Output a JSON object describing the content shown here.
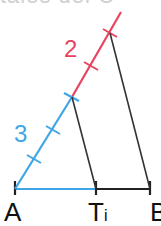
{
  "heading": {
    "clipped_text": "tales del C"
  },
  "colors": {
    "red": "#e8435f",
    "blue": "#3ea6e6",
    "black": "#222222"
  },
  "labels": {
    "segment_red": "2",
    "segment_blue": "3",
    "point_a": "A",
    "point_t": "T",
    "point_t_subscript": "i",
    "point_b": "B"
  },
  "geometry": {
    "point_a": [
      15,
      189
    ],
    "point_ti": [
      96,
      189
    ],
    "point_b": [
      150,
      189
    ],
    "junction": [
      72,
      97
    ],
    "red_top": [
      121,
      12
    ],
    "blue_ticks": [
      [
        34,
        159
      ],
      [
        53,
        130
      ],
      [
        72,
        97
      ]
    ],
    "red_ticks": [
      [
        91,
        66
      ],
      [
        110,
        33
      ]
    ],
    "ratio_blue_to_red": "3:2"
  }
}
